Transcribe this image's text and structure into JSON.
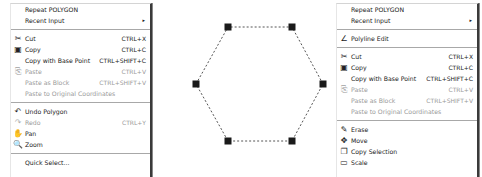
{
  "left_menu": {
    "items": [
      {
        "label": "Repeat POLYGON",
        "shortcut": "",
        "icon": "",
        "disabled": false
      },
      {
        "label": "Recent Input",
        "shortcut": "",
        "icon": "",
        "submenu": true,
        "arrow": "▸"
      },
      {
        "separator": true
      },
      {
        "label": "Cut",
        "shortcut": "CTRL+X",
        "icon": "scissors-icon",
        "glyph": "✂"
      },
      {
        "label": "Copy",
        "shortcut": "CTRL+C",
        "icon": "copy-icon",
        "glyph": "▣"
      },
      {
        "label": "Copy with Base Point",
        "shortcut": "CTRL+SHIFT+C",
        "icon": ""
      },
      {
        "label": "Paste",
        "shortcut": "CTRL+V",
        "icon": "paste-icon",
        "glyph": "⎘",
        "disabled": true
      },
      {
        "label": "Paste as Block",
        "shortcut": "CTRL+SHIFT+V",
        "icon": "",
        "disabled": true
      },
      {
        "label": "Paste to Original Coordinates",
        "shortcut": "",
        "icon": "",
        "disabled": true
      },
      {
        "separator": true
      },
      {
        "label": "Undo Polygon",
        "shortcut": "",
        "icon": "undo-icon",
        "glyph": "↶"
      },
      {
        "label": "Redo",
        "shortcut": "CTRL+Y",
        "icon": "redo-icon",
        "glyph": "↷",
        "disabled": true
      },
      {
        "label": "Pan",
        "shortcut": "",
        "icon": "pan-hand-icon",
        "glyph": "✋"
      },
      {
        "label": "Zoom",
        "shortcut": "",
        "icon": "zoom-icon",
        "glyph": "🔍"
      },
      {
        "separator": true
      },
      {
        "label": "Quick Select...",
        "shortcut": "",
        "icon": ""
      }
    ]
  },
  "right_menu": {
    "items": [
      {
        "label": "Repeat POLYGON",
        "shortcut": "",
        "icon": ""
      },
      {
        "label": "Recent Input",
        "shortcut": "",
        "icon": "",
        "submenu": true,
        "arrow": "▸"
      },
      {
        "separator": true
      },
      {
        "label": "Polyline Edit",
        "shortcut": "",
        "icon": "polyline-edit-icon",
        "glyph": "∠"
      },
      {
        "separator": true
      },
      {
        "label": "Cut",
        "shortcut": "CTRL+X",
        "icon": "scissors-icon",
        "glyph": "✂"
      },
      {
        "label": "Copy",
        "shortcut": "CTRL+C",
        "icon": "copy-icon",
        "glyph": "▣"
      },
      {
        "label": "Copy with Base Point",
        "shortcut": "CTRL+SHIFT+C",
        "icon": ""
      },
      {
        "label": "Paste",
        "shortcut": "CTRL+V",
        "icon": "paste-icon",
        "glyph": "⎘",
        "disabled": true
      },
      {
        "label": "Paste as Block",
        "shortcut": "CTRL+SHIFT+V",
        "icon": "",
        "disabled": true
      },
      {
        "label": "Paste to Original Coordinates",
        "shortcut": "",
        "icon": "",
        "disabled": true
      },
      {
        "separator": true
      },
      {
        "label": "Erase",
        "shortcut": "",
        "icon": "eraser-icon",
        "glyph": "✎"
      },
      {
        "label": "Move",
        "shortcut": "",
        "icon": "move-icon",
        "glyph": "✥"
      },
      {
        "label": "Copy Selection",
        "shortcut": "",
        "icon": "copy-selection-icon",
        "glyph": "❐"
      },
      {
        "label": "Scale",
        "shortcut": "",
        "icon": "scale-icon",
        "glyph": "▭"
      }
    ]
  },
  "canvas": {
    "shape": "hexagon",
    "vertices": [
      [
        196,
        84
      ],
      [
        228,
        27
      ],
      [
        292,
        27
      ],
      [
        323,
        84
      ],
      [
        292,
        141
      ],
      [
        228,
        141
      ]
    ],
    "grip_color": "#1a1a1a",
    "line_color": "#555555"
  }
}
